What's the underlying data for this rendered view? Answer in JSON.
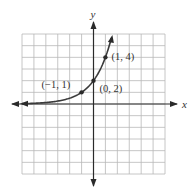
{
  "chart_data": {
    "type": "line",
    "title": "",
    "function": "y = 2 * 2^x",
    "xlabel": "x",
    "ylabel": "y",
    "xlim": [
      -6,
      6
    ],
    "ylim": [
      -6,
      6
    ],
    "grid": true,
    "grid_step": 1,
    "series": [
      {
        "name": "exponential curve",
        "x": [
          -6,
          -5,
          -4,
          -3,
          -2,
          -1,
          0,
          1,
          1.5
        ],
        "y": [
          0.03125,
          0.0625,
          0.125,
          0.25,
          0.5,
          1,
          2,
          4,
          5.66
        ]
      }
    ],
    "points": [
      {
        "x": -1,
        "y": 1,
        "label": "(−1, 1)"
      },
      {
        "x": 0,
        "y": 2,
        "label": "(0, 2)"
      },
      {
        "x": 1,
        "y": 4,
        "label": "(1, 4)"
      }
    ],
    "arrows": {
      "curve_left": true,
      "curve_right": true,
      "axes": true
    }
  }
}
